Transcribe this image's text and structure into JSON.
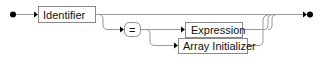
{
  "diagram": {
    "type": "railroad-syntax-diagram",
    "colors": {
      "line": "#9a9a9a",
      "box_stroke": "#8a8a8a",
      "box_fill": "#ffffff",
      "text": "#111111",
      "terminator": "#000000"
    },
    "nodes": {
      "identifier": {
        "label": "Identifier",
        "kind": "nonterminal"
      },
      "equals": {
        "label": "=",
        "kind": "terminal"
      },
      "expression": {
        "label": "Expression",
        "kind": "nonterminal"
      },
      "array_initializer": {
        "label": "Array Initializer",
        "kind": "nonterminal"
      }
    },
    "structure": "Identifier followed by optional ( '=' followed by ( Expression | Array Initializer ) )"
  }
}
